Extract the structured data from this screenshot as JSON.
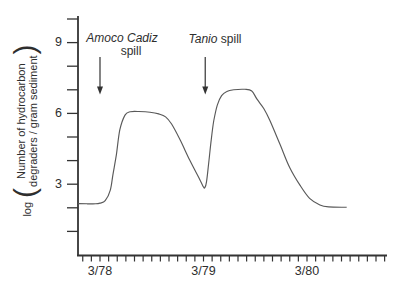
{
  "figure": {
    "background": "#ffffff",
    "ink_color": "#333333",
    "curve_color": "#595959"
  },
  "y_axis_label": {
    "prefix": "log",
    "open_paren": "(",
    "line1": "Number of hydrocarbon",
    "line2": "degraders / gram sediment",
    "close_paren": ")"
  },
  "chart_data": {
    "type": "line",
    "title": "",
    "xlabel": "",
    "ylabel": "log ( Number of hydrocarbon degraders / gram sediment )",
    "x_unit": "months relative to 3/78",
    "grid": false,
    "legend": "none",
    "x_axis": {
      "tick_labels": [
        {
          "label": "3/78",
          "month": 0
        },
        {
          "label": "3/79",
          "month": 12
        },
        {
          "label": "3/80",
          "month": 24
        }
      ],
      "minor_tick_months": {
        "first": -2,
        "last": 33,
        "step": 1
      },
      "range_months": [
        -2.55,
        33.5
      ]
    },
    "y_axis": {
      "labeled_ticks": [
        {
          "label": "3",
          "value": 3
        },
        {
          "label": "6",
          "value": 6
        },
        {
          "label": "9",
          "value": 9
        }
      ],
      "minor_tick_values": [
        1,
        2,
        3,
        4,
        5,
        6,
        7,
        8,
        9,
        10
      ],
      "range": [
        0,
        10.2
      ]
    },
    "series": [
      {
        "name": "log hydrocarbon degraders per gram sediment",
        "points": [
          [
            -2.55,
            2.18
          ],
          [
            -1.5,
            2.17
          ],
          [
            -0.5,
            2.17
          ],
          [
            0,
            2.2
          ],
          [
            0.6,
            2.3
          ],
          [
            1.2,
            2.75
          ],
          [
            1.5,
            3.4
          ],
          [
            1.9,
            4.25
          ],
          [
            2.3,
            5.3
          ],
          [
            2.9,
            5.93
          ],
          [
            3.5,
            6.07
          ],
          [
            4.5,
            6.08
          ],
          [
            5.8,
            6.05
          ],
          [
            6.8,
            5.98
          ],
          [
            7.6,
            5.85
          ],
          [
            8.3,
            5.55
          ],
          [
            9.3,
            4.87
          ],
          [
            10.4,
            4.02
          ],
          [
            11.6,
            3.17
          ],
          [
            12.0,
            2.88
          ],
          [
            12.15,
            2.85
          ],
          [
            12.35,
            3.1
          ],
          [
            12.6,
            3.9
          ],
          [
            12.9,
            4.9
          ],
          [
            13.2,
            5.7
          ],
          [
            13.6,
            6.35
          ],
          [
            14.1,
            6.75
          ],
          [
            14.7,
            6.93
          ],
          [
            15.5,
            7.0
          ],
          [
            16.8,
            7.02
          ],
          [
            17.6,
            6.95
          ],
          [
            18.2,
            6.6
          ],
          [
            19.0,
            6.2
          ],
          [
            19.7,
            5.7
          ],
          [
            20.9,
            4.66
          ],
          [
            22.0,
            3.7
          ],
          [
            23.2,
            2.95
          ],
          [
            24.3,
            2.4
          ],
          [
            25.5,
            2.12
          ],
          [
            26.5,
            2.04
          ],
          [
            28.6,
            2.02
          ]
        ]
      }
    ],
    "annotations": [
      {
        "id": "amoco",
        "italic_text": "Amoco Cadiz",
        "regular_text": "spill",
        "layout": "two-line",
        "arrow_month": 0,
        "arrow_tip_value": 6.8
      },
      {
        "id": "tanio",
        "italic_text": "Tanio",
        "regular_text": "spill",
        "layout": "one-line",
        "arrow_month": 12.2,
        "arrow_tip_value": 6.8
      }
    ]
  }
}
